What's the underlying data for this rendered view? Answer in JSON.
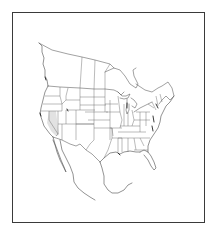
{
  "map": {
    "type": "outline-map",
    "region": "North America (contiguous United States with portions of Canada and Mexico)",
    "frame": {
      "border_color": "#3a3a3a",
      "background": "#ffffff"
    },
    "line_color": "#555555",
    "highlighted_region": {
      "area": "southern Nevada / eastern California",
      "fill_color": "#e2e2e2"
    },
    "accent_marks_color": "#222222",
    "labels": []
  }
}
